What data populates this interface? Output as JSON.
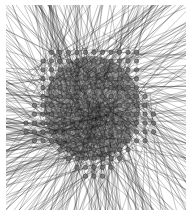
{
  "diagram": {
    "type": "network-graph",
    "layout": "grid-lattice",
    "width": 193,
    "height": 217,
    "frame": {
      "x0": 6,
      "y0": 5,
      "x1": 186,
      "y1": 210
    },
    "grid": {
      "cols": 21,
      "rows": 23,
      "x0": 9,
      "y0": 8,
      "dx": 8.5,
      "dy": 8.85
    },
    "center": {
      "x": 92,
      "y": 108
    },
    "core_radius": 62,
    "node": {
      "radius": 2.2,
      "fill": "#6e6e6e",
      "stroke": "#2a2a2a"
    },
    "edge": {
      "color": "#1c1c1c",
      "width": 0.45,
      "opacity": 0.55,
      "count": 520
    },
    "colors": {
      "background": "#ffffff",
      "core": "#5a5a5a"
    }
  }
}
